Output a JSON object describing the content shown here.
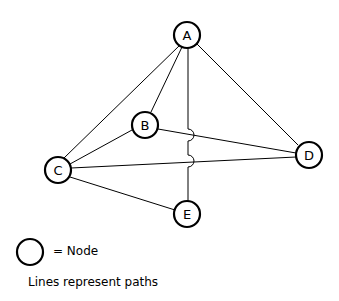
{
  "diagram": {
    "nodes": [
      {
        "id": "A",
        "label": "A",
        "x": 187,
        "y": 35
      },
      {
        "id": "B",
        "label": "B",
        "x": 145,
        "y": 125
      },
      {
        "id": "C",
        "label": "C",
        "x": 58,
        "y": 170
      },
      {
        "id": "D",
        "label": "D",
        "x": 309,
        "y": 155
      },
      {
        "id": "E",
        "label": "E",
        "x": 187,
        "y": 214
      }
    ],
    "edges": [
      {
        "from": "A",
        "to": "C"
      },
      {
        "from": "A",
        "to": "B"
      },
      {
        "from": "A",
        "to": "E",
        "crossing_hops": 2
      },
      {
        "from": "A",
        "to": "D"
      },
      {
        "from": "B",
        "to": "C"
      },
      {
        "from": "B",
        "to": "D"
      },
      {
        "from": "C",
        "to": "D"
      },
      {
        "from": "C",
        "to": "E"
      }
    ]
  },
  "legend": {
    "node_label": "= Node",
    "caption": "Lines represent paths"
  }
}
